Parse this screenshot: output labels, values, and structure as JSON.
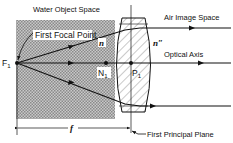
{
  "diagram": {
    "type": "optics-ray-diagram",
    "regions": {
      "object_space": {
        "label": "Water Object Space",
        "fill": "#b8b8b8"
      },
      "image_space": {
        "label": "Air Image Space"
      }
    },
    "labels": {
      "first_focal_point": "First Focal Point",
      "optical_axis": "Optical Axis",
      "first_principal_plane": "First Principal Plane",
      "focal_length": "f",
      "refractive_index_object": "n",
      "refractive_index_image": "n″"
    },
    "points": {
      "focal_point": {
        "main": "F",
        "sub": "1"
      },
      "nodal_point": {
        "main": "N",
        "sub": "1"
      },
      "principal_point": {
        "main": "P",
        "sub": "1"
      }
    },
    "colors": {
      "line": "#111111",
      "shade": "#b8b8b8",
      "lens_hatch": "#555555",
      "background": "#ffffff"
    }
  }
}
